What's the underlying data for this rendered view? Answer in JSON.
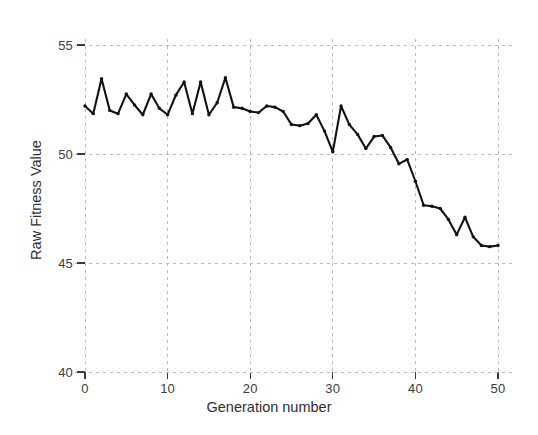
{
  "chart_data": {
    "type": "line",
    "title": "",
    "subtitle": "",
    "xlabel": "Generation number",
    "ylabel": "Raw Fitness Value",
    "xlim": [
      0,
      50
    ],
    "ylim": [
      40,
      55
    ],
    "xticks": [
      0,
      10,
      20,
      30,
      40,
      50
    ],
    "yticks": [
      40,
      45,
      50,
      55
    ],
    "xtick_labels": [
      "0",
      "10",
      "20",
      "30",
      "40",
      "50"
    ],
    "ytick_labels": [
      "40",
      "45",
      "50",
      "55"
    ],
    "grid": true,
    "grid_style": "dashed",
    "legend": null,
    "legend_position": "none",
    "series": [
      {
        "name": "Raw fitness",
        "color": "#111111",
        "marker": "dot",
        "x": [
          0,
          1,
          2,
          3,
          4,
          5,
          6,
          7,
          8,
          9,
          10,
          11,
          12,
          13,
          14,
          15,
          16,
          17,
          18,
          19,
          20,
          21,
          22,
          23,
          24,
          25,
          26,
          27,
          28,
          29,
          30,
          31,
          32,
          33,
          34,
          35,
          36,
          37,
          38,
          39,
          40,
          41,
          42,
          43,
          44,
          45,
          46,
          47,
          48,
          49,
          50
        ],
        "values": [
          52.2,
          51.85,
          53.45,
          52.0,
          51.85,
          52.75,
          52.25,
          51.8,
          52.75,
          52.1,
          51.8,
          52.7,
          53.3,
          51.85,
          53.3,
          51.8,
          52.35,
          53.5,
          52.15,
          52.1,
          51.95,
          51.9,
          52.2,
          52.15,
          51.95,
          51.35,
          51.3,
          51.4,
          51.8,
          51.05,
          50.1,
          52.2,
          51.35,
          50.9,
          50.25,
          50.8,
          50.85,
          50.3,
          49.55,
          49.75,
          48.75,
          47.65,
          47.6,
          47.5,
          47.0,
          46.3,
          47.1,
          46.2,
          45.8,
          45.75,
          45.8
        ]
      }
    ]
  },
  "axis": {
    "x_tick_labels": [
      "0",
      "10",
      "20",
      "30",
      "40",
      "50"
    ],
    "y_tick_labels": [
      "55",
      "50",
      "45",
      "40"
    ]
  },
  "labels": {
    "x_axis_title": "Generation number",
    "y_axis_title": "Raw Fitness Value"
  }
}
